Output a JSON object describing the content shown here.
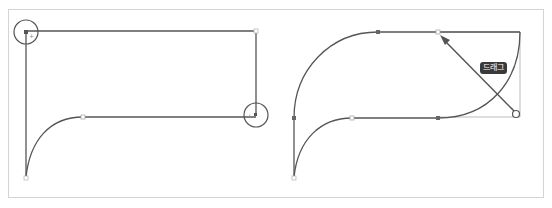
{
  "diagram": {
    "left_panel": {
      "description": "Rectangle path with two highlighted anchor points (top-left and bottom-right) and a curved path segment",
      "highlighted_anchors": [
        "top-left",
        "bottom-right"
      ]
    },
    "right_panel": {
      "description": "Curved path being dragged from bottom-right corner toward top, creating arc",
      "drag_label": "드래그"
    },
    "colors": {
      "stroke": "#555555",
      "light_stroke": "#bbbbbb",
      "badge_bg": "#3a3a3a",
      "frame": "#d4d4d4"
    }
  }
}
